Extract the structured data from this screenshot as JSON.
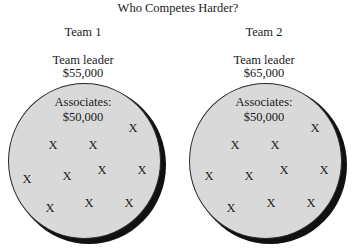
{
  "title": "Who Competes Harder?",
  "colors": {
    "circle_fill": "#d9d9d9",
    "shadow": "#111111",
    "text": "#1a1a1a"
  },
  "teams": [
    {
      "label": "Team 1",
      "leader_label": "Team leader",
      "leader_salary": "$55,000",
      "associates_label": "Associates:",
      "associates_salary": "$50,000",
      "marker": "X",
      "marker_count": 10
    },
    {
      "label": "Team 2",
      "leader_label": "Team leader",
      "leader_salary": "$65,000",
      "associates_label": "Associates:",
      "associates_salary": "$50,000",
      "marker": "X",
      "marker_count": 10
    }
  ]
}
